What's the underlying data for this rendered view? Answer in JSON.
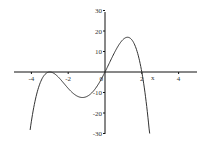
{
  "chart_data": {
    "type": "line",
    "title": "",
    "xlabel": "x",
    "ylabel": "",
    "xlim": [
      -5,
      5
    ],
    "ylim": [
      -30,
      30
    ],
    "grid": false,
    "x_ticks": [
      -4,
      -2,
      0,
      2,
      4
    ],
    "x_tick_labels": [
      "-4",
      "-2",
      "0",
      "2",
      "4"
    ],
    "y_ticks": [
      30,
      20,
      10,
      -10,
      -20,
      -30
    ],
    "y_tick_labels": [
      "30",
      "20",
      "10",
      "-10",
      "-20",
      "-30"
    ],
    "series": [
      {
        "name": "f(x) = -x(x+3)^2(x-2)",
        "x": [
          -4.07,
          -3.8,
          -3.5,
          -3.0,
          -2.5,
          -2.0,
          -1.5,
          -1.2,
          -1.0,
          -0.5,
          0.0,
          0.5,
          1.0,
          1.3,
          1.5,
          2.0,
          2.2,
          2.43
        ],
        "y": [
          -30,
          -16.9,
          -4.8,
          0,
          2.8,
          8,
          11.3,
          12.4,
          12,
          7.8,
          0,
          -9.2,
          -16,
          -16.8,
          -15.2,
          0,
          11.2,
          30
        ],
        "note": "y values stored negated in plot orientation is NOT used; see values_display"
      }
    ],
    "curve_points": {
      "x": [
        -4.07,
        -3.8,
        -3.5,
        -3.0,
        -2.5,
        -2.0,
        -1.5,
        -1.2,
        -1.0,
        -0.5,
        0.0,
        0.5,
        1.0,
        1.3,
        1.5,
        2.0,
        2.2,
        2.43
      ],
      "y": [
        -30,
        -16.9,
        -4.8,
        0,
        -2.8,
        -8,
        -11.3,
        -12.4,
        -12,
        -7.8,
        0,
        9.2,
        16,
        16.8,
        15.2,
        0,
        -11.2,
        -30
      ]
    }
  }
}
